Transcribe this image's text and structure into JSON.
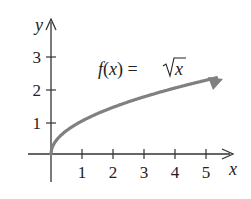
{
  "chart_data": {
    "type": "line",
    "title": "",
    "annotation": "f(x) = √x",
    "function": "sqrt(x)",
    "xlabel": "x",
    "ylabel": "y",
    "x_ticks": [
      1,
      2,
      3,
      4,
      5
    ],
    "y_ticks": [
      1,
      2,
      3
    ],
    "xlim": [
      -0.75,
      6.0
    ],
    "ylim": [
      -0.85,
      4.0
    ],
    "grid": false,
    "legend": null,
    "series": [
      {
        "name": "f(x) = √x",
        "color": "#808080",
        "arrow_end": true,
        "x": [
          0,
          0.25,
          0.5,
          1,
          1.5,
          2,
          2.5,
          3,
          3.5,
          4,
          4.5,
          5,
          5.5
        ],
        "y": [
          0,
          0.5,
          0.707,
          1,
          1.225,
          1.414,
          1.581,
          1.732,
          1.871,
          2,
          2.121,
          2.236,
          2.345
        ]
      }
    ]
  },
  "labels": {
    "x_axis": "x",
    "y_axis": "y",
    "func_lhs": "f(x) = ",
    "func_rad": "x",
    "x_tick_labels": [
      "1",
      "2",
      "3",
      "4",
      "5"
    ],
    "y_tick_labels": [
      "1",
      "2",
      "3"
    ]
  },
  "colors": {
    "axis": "#333333",
    "curve": "#808080",
    "text": "#222222"
  }
}
